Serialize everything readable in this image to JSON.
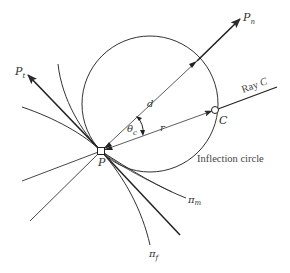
{
  "figure": {
    "type": "kinematics diagram",
    "colors": {
      "line": "#2a2a2a",
      "background": "#ffffff",
      "text": "#333333"
    },
    "labels": {
      "pn": {
        "main": "P",
        "sub": "n"
      },
      "pt": {
        "main": "P",
        "sub": "t"
      },
      "d": "d",
      "r": "r",
      "theta": {
        "main": "θ",
        "sub": "c"
      },
      "p": "P",
      "c": "C",
      "ray_c": {
        "text": "Ray ",
        "ital": "C"
      },
      "inflection_circle": "Inflection circle",
      "pi_m": {
        "main": "π",
        "sub": "m"
      },
      "pi_f": {
        "main": "π",
        "sub": "f"
      }
    }
  }
}
